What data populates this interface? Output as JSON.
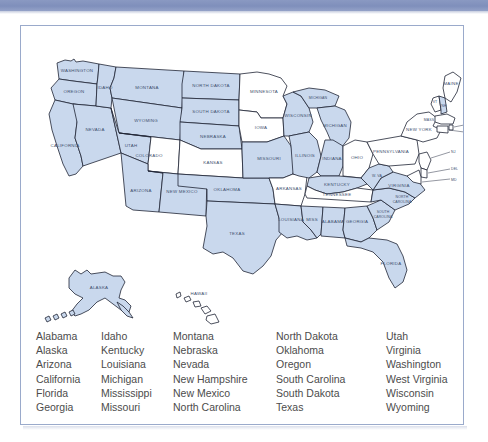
{
  "page": {
    "band_color": "#8292bd",
    "frame_border_color": "#9aaacb",
    "state_fill_color": "#c9d8ed",
    "state_empty_color": "#ffffff",
    "state_outline_color": "#1f2535",
    "map_label_color": "#41506e",
    "list_text_color": "#4c4c4c"
  },
  "map": {
    "name": "us-states-map",
    "labels": {
      "washington": "WASHINGTON",
      "oregon": "OREGON",
      "california": "CALIFORNIA",
      "nevada": "NEVADA",
      "idaho": "IDAHO",
      "montana": "MONTANA",
      "wyoming": "WYOMING",
      "utah": "UTAH",
      "colorado": "COLORADO",
      "arizona": "ARIZONA",
      "new_mexico": "NEW MEXICO",
      "north_dakota": "NORTH DAKOTA",
      "south_dakota": "SOUTH DAKOTA",
      "nebraska": "NEBRASKA",
      "kansas": "KANSAS",
      "oklahoma": "OKLAHOMA",
      "texas": "TEXAS",
      "minnesota": "MINNESOTA",
      "iowa": "IOWA",
      "missouri": "MISSOURI",
      "arkansas": "ARKANSAS",
      "louisiana": "LOUISIANA",
      "wisconsin": "WISCONSIN",
      "illinois": "ILLINOIS",
      "michigan": "MICHIGAN",
      "upper_michigan": "MICHIGAN",
      "indiana": "INDIANA",
      "ohio": "OHIO",
      "kentucky": "KENTUCKY",
      "tennessee": "TENNESSEE",
      "mississippi": "MISS",
      "alabama": "ALABAMA",
      "georgia": "GEORGIA",
      "florida": "FLORIDA",
      "south_carolina": "SOUTH CAROLINA",
      "north_carolina": "NORTH CAROLINA",
      "virginia": "VIRGINIA",
      "west_virginia": "W. VA",
      "pennsylvania": "PENNSYLVANIA",
      "new_york": "NEW YORK",
      "maine": "MAINE",
      "vermont": "VT",
      "new_hampshire": "NH",
      "massachusetts": "MASS",
      "rhode_island": "RI",
      "connecticut": "CONN",
      "new_jersey": "NJ",
      "delaware": "DEL",
      "maryland": "MD",
      "alaska": "ALASKA",
      "hawaii": "HAWAII"
    }
  },
  "state_list": {
    "name": "selected-states-list",
    "columns": [
      [
        "Alabama",
        "Alaska",
        "Arizona",
        "California",
        "Florida",
        "Georgia"
      ],
      [
        "Idaho",
        "Kentucky",
        "Louisiana",
        "Michigan",
        "Mississippi",
        "Missouri"
      ],
      [
        "Montana",
        "Nebraska",
        "Nevada",
        "New Hampshire",
        "New Mexico",
        "North Carolina"
      ],
      [
        "North Dakota",
        "Oklahoma",
        "Oregon",
        "South Carolina",
        "South Dakota",
        "Texas"
      ],
      [
        "Utah",
        "Virginia",
        "Washington",
        "West Virginia",
        "Wisconsin",
        "Wyoming"
      ]
    ]
  }
}
